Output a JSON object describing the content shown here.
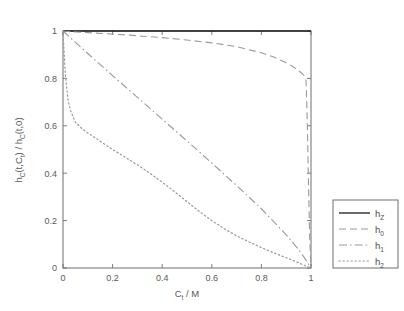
{
  "chart_data": {
    "type": "line",
    "title": "",
    "xlabel": "C_t / M",
    "xlabel_base": "C",
    "xlabel_sub": "t",
    "xlabel_tail": " / M",
    "ylabel": "h_C(t,C_t) / h_C(t,0)",
    "ylabel_parts": {
      "p1": "h",
      "p1sub": "C",
      "p2": "(t,C",
      "p2sub": "t",
      "p3": ") / h",
      "p3sub": "C",
      "p4": "(t,0)"
    },
    "xlim": [
      0,
      1
    ],
    "ylim": [
      0,
      1
    ],
    "xticks": [
      0,
      0.2,
      0.4,
      0.6,
      0.8,
      1
    ],
    "xticklabels": [
      "0",
      "0.2",
      "0.4",
      "0.6",
      "0.8",
      "1"
    ],
    "yticks": [
      0,
      0.2,
      0.4,
      0.6,
      0.8,
      1
    ],
    "yticklabels": [
      "0",
      "0.2",
      "0.4",
      "0.6",
      "0.8",
      "1"
    ],
    "grid": false,
    "legend_position": "outside-right-bottom",
    "box": true,
    "series": [
      {
        "name": "h_Z",
        "label_base": "h",
        "label_sub": "Z",
        "style": "solid",
        "color": "#1a1a1a",
        "width": 1.3,
        "x": [
          0,
          0.05,
          0.1,
          0.2,
          0.3,
          0.4,
          0.5,
          0.6,
          0.7,
          0.8,
          0.9,
          0.95,
          0.99,
          1
        ],
        "values": [
          1,
          1,
          1,
          1,
          1,
          1,
          1,
          1,
          1,
          1,
          1,
          1,
          1,
          1
        ]
      },
      {
        "name": "h_0",
        "label_base": "h",
        "label_sub": "0",
        "style": "dashed",
        "color": "#9a9a9a",
        "width": 1.1,
        "x": [
          0,
          0.02,
          0.05,
          0.1,
          0.2,
          0.3,
          0.4,
          0.5,
          0.6,
          0.7,
          0.8,
          0.85,
          0.9,
          0.93,
          0.95,
          0.96,
          0.97,
          0.975,
          0.98,
          0.985,
          0.99,
          0.995,
          1
        ],
        "values": [
          1.0,
          0.998,
          0.996,
          0.993,
          0.987,
          0.98,
          0.972,
          0.962,
          0.95,
          0.934,
          0.908,
          0.89,
          0.866,
          0.848,
          0.833,
          0.824,
          0.815,
          0.81,
          0.79,
          0.62,
          0.35,
          0.12,
          0.0
        ]
      },
      {
        "name": "h_1",
        "label_base": "h",
        "label_sub": "1",
        "style": "dashdot",
        "color": "#9a9a9a",
        "width": 1.1,
        "x": [
          0,
          0.05,
          0.1,
          0.2,
          0.3,
          0.4,
          0.5,
          0.6,
          0.7,
          0.8,
          0.9,
          0.95,
          0.98,
          1
        ],
        "values": [
          1.0,
          0.952,
          0.905,
          0.812,
          0.72,
          0.628,
          0.536,
          0.443,
          0.348,
          0.25,
          0.14,
          0.078,
          0.033,
          0.0
        ]
      },
      {
        "name": "h_2",
        "label_base": "h",
        "label_sub": "2",
        "style": "dotted",
        "color": "#9a9a9a",
        "width": 1.2,
        "x": [
          0,
          0.005,
          0.01,
          0.02,
          0.03,
          0.05,
          0.08,
          0.1,
          0.15,
          0.2,
          0.25,
          0.3,
          0.35,
          0.4,
          0.45,
          0.5,
          0.55,
          0.6,
          0.65,
          0.7,
          0.75,
          0.8,
          0.85,
          0.9,
          0.95,
          0.98,
          1
        ],
        "values": [
          1.0,
          0.9,
          0.81,
          0.71,
          0.665,
          0.615,
          0.585,
          0.57,
          0.535,
          0.5,
          0.468,
          0.435,
          0.4,
          0.362,
          0.322,
          0.28,
          0.238,
          0.2,
          0.166,
          0.136,
          0.11,
          0.086,
          0.064,
          0.043,
          0.022,
          0.008,
          0.0
        ]
      }
    ]
  },
  "legend": {
    "entries": [
      {
        "label_base": "h",
        "label_sub": "Z"
      },
      {
        "label_base": "h",
        "label_sub": "0"
      },
      {
        "label_base": "h",
        "label_sub": "1"
      },
      {
        "label_base": "h",
        "label_sub": "2"
      }
    ]
  },
  "colors": {
    "axis": "#6e6e6e",
    "solid_line": "#1a1a1a",
    "gray_line": "#9a9a9a",
    "text": "#5a5a5a",
    "background": "#ffffff",
    "legend_border": "#6e6e6e"
  }
}
